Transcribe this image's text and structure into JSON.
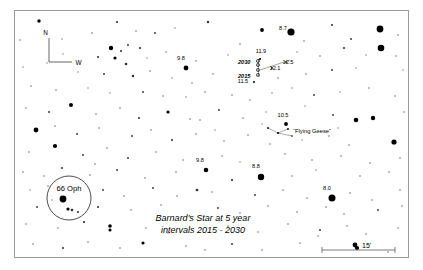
{
  "chart_data": {
    "type": "scatter",
    "title": "Barnard's Star at 5 year intervals 2015 - 2030",
    "subtitle": "",
    "xlabel": "",
    "ylabel": "",
    "grid": false,
    "legend_position": "none",
    "caption_line1": "Barnard's Star at 5 year",
    "caption_line2": "intervals 2015 - 2030",
    "compass": {
      "north_label": "N",
      "west_label": "W"
    },
    "scale_bar": {
      "label": "15'",
      "value": 15,
      "unit": "arcminutes"
    },
    "named_objects": [
      {
        "name": "66 Oph",
        "x": 69,
        "y": 198,
        "circled": true,
        "circle_radius": 22
      }
    ],
    "asterisms": [
      {
        "name": "“Flying Geese”",
        "label_x": 290,
        "label_y": 131
      }
    ],
    "barnard_track": {
      "epochs": [
        {
          "label": "2015",
          "x": 258,
          "y": 75
        },
        {
          "label": "2020",
          "x": 258,
          "y": 70
        },
        {
          "label": "2025",
          "x": 258,
          "y": 65
        },
        {
          "label": "2030",
          "x": 258,
          "y": 61
        }
      ],
      "epoch_labels_shown": [
        "2030",
        "2015"
      ]
    },
    "magnitude_labels": [
      {
        "mag": "8.7",
        "x": 283,
        "y": 30,
        "star_x": 291,
        "star_y": 32,
        "r": 3.6
      },
      {
        "mag": "11.9",
        "x": 261,
        "y": 53,
        "star_x": 260,
        "star_y": 59,
        "r": 1.1
      },
      {
        "mag": "12.5",
        "x": 288,
        "y": 64,
        "star_x": 286,
        "star_y": 62,
        "r": 0.9
      },
      {
        "mag": "12.1",
        "x": 275,
        "y": 70,
        "star_x": 272,
        "star_y": 68,
        "r": 0.9
      },
      {
        "mag": "11.5",
        "x": 243,
        "y": 83,
        "star_x": 254,
        "star_y": 82,
        "r": 1.0
      },
      {
        "mag": "9.8",
        "x": 181,
        "y": 60,
        "star_x": 186,
        "star_y": 68,
        "r": 2.4
      },
      {
        "mag": "10.5",
        "x": 283,
        "y": 117,
        "star_x": 286,
        "star_y": 124,
        "r": 1.9
      },
      {
        "mag": "9.8",
        "x": 200,
        "y": 162,
        "star_x": 206,
        "star_y": 170,
        "r": 2.3
      },
      {
        "mag": "8.8",
        "x": 256,
        "y": 168,
        "star_x": 261,
        "star_y": 177,
        "r": 3.2
      },
      {
        "mag": "8.0",
        "x": 327,
        "y": 190,
        "star_x": 332,
        "star_y": 198,
        "r": 3.5
      }
    ],
    "field_stars": [
      {
        "x": 39,
        "y": 21,
        "r": 1.7
      },
      {
        "x": 117,
        "y": 22,
        "r": 1.1
      },
      {
        "x": 208,
        "y": 22,
        "r": 1.2
      },
      {
        "x": 262,
        "y": 30,
        "r": 1.9
      },
      {
        "x": 332,
        "y": 25,
        "r": 1.0
      },
      {
        "x": 380,
        "y": 29,
        "r": 3.4
      },
      {
        "x": 20,
        "y": 40,
        "r": 0.8
      },
      {
        "x": 62,
        "y": 39,
        "r": 0.7
      },
      {
        "x": 92,
        "y": 33,
        "r": 0.8
      },
      {
        "x": 136,
        "y": 31,
        "r": 0.8
      },
      {
        "x": 155,
        "y": 33,
        "r": 0.9
      },
      {
        "x": 175,
        "y": 28,
        "r": 0.7
      },
      {
        "x": 240,
        "y": 44,
        "r": 0.8
      },
      {
        "x": 304,
        "y": 41,
        "r": 0.8
      },
      {
        "x": 351,
        "y": 39,
        "r": 0.9
      },
      {
        "x": 381,
        "y": 48,
        "r": 3.3
      },
      {
        "x": 398,
        "y": 35,
        "r": 0.8
      },
      {
        "x": 111,
        "y": 48,
        "r": 2.2
      },
      {
        "x": 121,
        "y": 51,
        "r": 1.0
      },
      {
        "x": 128,
        "y": 45,
        "r": 0.9
      },
      {
        "x": 140,
        "y": 48,
        "r": 1.1
      },
      {
        "x": 98,
        "y": 57,
        "r": 1.0
      },
      {
        "x": 115,
        "y": 58,
        "r": 1.6
      },
      {
        "x": 126,
        "y": 64,
        "r": 1.3
      },
      {
        "x": 147,
        "y": 58,
        "r": 0.7
      },
      {
        "x": 166,
        "y": 52,
        "r": 0.8
      },
      {
        "x": 196,
        "y": 61,
        "r": 0.8
      },
      {
        "x": 228,
        "y": 55,
        "r": 0.7
      },
      {
        "x": 297,
        "y": 52,
        "r": 0.7
      },
      {
        "x": 320,
        "y": 56,
        "r": 0.8
      },
      {
        "x": 344,
        "y": 48,
        "r": 1.0
      },
      {
        "x": 366,
        "y": 55,
        "r": 0.7
      },
      {
        "x": 396,
        "y": 56,
        "r": 0.8
      },
      {
        "x": 23,
        "y": 67,
        "r": 0.7
      },
      {
        "x": 47,
        "y": 63,
        "r": 0.7
      },
      {
        "x": 63,
        "y": 54,
        "r": 0.7
      },
      {
        "x": 78,
        "y": 72,
        "r": 0.7
      },
      {
        "x": 104,
        "y": 74,
        "r": 0.9
      },
      {
        "x": 133,
        "y": 76,
        "r": 1.2
      },
      {
        "x": 150,
        "y": 71,
        "r": 0.8
      },
      {
        "x": 172,
        "y": 78,
        "r": 0.7
      },
      {
        "x": 192,
        "y": 83,
        "r": 0.8
      },
      {
        "x": 213,
        "y": 74,
        "r": 0.8
      },
      {
        "x": 278,
        "y": 78,
        "r": 0.8
      },
      {
        "x": 306,
        "y": 74,
        "r": 0.8
      },
      {
        "x": 332,
        "y": 70,
        "r": 0.9
      },
      {
        "x": 356,
        "y": 68,
        "r": 0.7
      },
      {
        "x": 403,
        "y": 70,
        "r": 0.7
      },
      {
        "x": 31,
        "y": 86,
        "r": 0.8
      },
      {
        "x": 56,
        "y": 90,
        "r": 0.8
      },
      {
        "x": 88,
        "y": 88,
        "r": 0.7
      },
      {
        "x": 110,
        "y": 93,
        "r": 0.7
      },
      {
        "x": 143,
        "y": 92,
        "r": 0.9
      },
      {
        "x": 163,
        "y": 96,
        "r": 0.8
      },
      {
        "x": 186,
        "y": 97,
        "r": 0.7
      },
      {
        "x": 205,
        "y": 92,
        "r": 0.8
      },
      {
        "x": 232,
        "y": 95,
        "r": 0.8
      },
      {
        "x": 250,
        "y": 100,
        "r": 0.8
      },
      {
        "x": 272,
        "y": 93,
        "r": 0.7
      },
      {
        "x": 292,
        "y": 88,
        "r": 0.7
      },
      {
        "x": 314,
        "y": 95,
        "r": 0.9
      },
      {
        "x": 340,
        "y": 92,
        "r": 0.7
      },
      {
        "x": 369,
        "y": 88,
        "r": 0.8
      },
      {
        "x": 395,
        "y": 96,
        "r": 0.8
      },
      {
        "x": 26,
        "y": 108,
        "r": 0.8
      },
      {
        "x": 49,
        "y": 112,
        "r": 0.9
      },
      {
        "x": 71,
        "y": 105,
        "r": 2.0
      },
      {
        "x": 96,
        "y": 114,
        "r": 0.8
      },
      {
        "x": 120,
        "y": 108,
        "r": 0.8
      },
      {
        "x": 139,
        "y": 118,
        "r": 1.0
      },
      {
        "x": 168,
        "y": 112,
        "r": 1.6
      },
      {
        "x": 190,
        "y": 119,
        "r": 0.8
      },
      {
        "x": 219,
        "y": 110,
        "r": 0.9
      },
      {
        "x": 243,
        "y": 118,
        "r": 0.8
      },
      {
        "x": 266,
        "y": 112,
        "r": 0.7
      },
      {
        "x": 305,
        "y": 106,
        "r": 0.7
      },
      {
        "x": 333,
        "y": 115,
        "r": 0.9
      },
      {
        "x": 356,
        "y": 120,
        "r": 2.3
      },
      {
        "x": 373,
        "y": 118,
        "r": 2.2
      },
      {
        "x": 404,
        "y": 112,
        "r": 0.8
      },
      {
        "x": 36,
        "y": 130,
        "r": 2.4
      },
      {
        "x": 55,
        "y": 126,
        "r": 0.8
      },
      {
        "x": 77,
        "y": 134,
        "r": 0.9
      },
      {
        "x": 99,
        "y": 128,
        "r": 0.8
      },
      {
        "x": 132,
        "y": 136,
        "r": 0.9
      },
      {
        "x": 151,
        "y": 130,
        "r": 0.8
      },
      {
        "x": 172,
        "y": 140,
        "r": 1.0
      },
      {
        "x": 196,
        "y": 134,
        "r": 0.8
      },
      {
        "x": 224,
        "y": 141,
        "r": 0.8
      },
      {
        "x": 248,
        "y": 135,
        "r": 0.8
      },
      {
        "x": 270,
        "y": 144,
        "r": 0.8
      },
      {
        "x": 302,
        "y": 140,
        "r": 0.7
      },
      {
        "x": 329,
        "y": 136,
        "r": 0.8
      },
      {
        "x": 349,
        "y": 145,
        "r": 0.8
      },
      {
        "x": 394,
        "y": 142,
        "r": 2.6
      },
      {
        "x": 55,
        "y": 146,
        "r": 2.1
      },
      {
        "x": 29,
        "y": 152,
        "r": 0.8
      },
      {
        "x": 83,
        "y": 155,
        "r": 0.9
      },
      {
        "x": 107,
        "y": 148,
        "r": 0.8
      },
      {
        "x": 128,
        "y": 158,
        "r": 0.9
      },
      {
        "x": 156,
        "y": 152,
        "r": 0.8
      },
      {
        "x": 183,
        "y": 160,
        "r": 0.8
      },
      {
        "x": 222,
        "y": 156,
        "r": 0.8
      },
      {
        "x": 240,
        "y": 162,
        "r": 0.7
      },
      {
        "x": 285,
        "y": 154,
        "r": 0.8
      },
      {
        "x": 312,
        "y": 160,
        "r": 0.8
      },
      {
        "x": 341,
        "y": 156,
        "r": 0.8
      },
      {
        "x": 370,
        "y": 163,
        "r": 0.8
      },
      {
        "x": 400,
        "y": 158,
        "r": 0.8
      },
      {
        "x": 23,
        "y": 172,
        "r": 0.8
      },
      {
        "x": 62,
        "y": 168,
        "r": 1.0
      },
      {
        "x": 90,
        "y": 175,
        "r": 0.8
      },
      {
        "x": 117,
        "y": 170,
        "r": 0.9
      },
      {
        "x": 145,
        "y": 178,
        "r": 0.8
      },
      {
        "x": 176,
        "y": 172,
        "r": 0.8
      },
      {
        "x": 232,
        "y": 180,
        "r": 1.1
      },
      {
        "x": 292,
        "y": 176,
        "r": 0.8
      },
      {
        "x": 316,
        "y": 170,
        "r": 0.7
      },
      {
        "x": 360,
        "y": 176,
        "r": 0.8
      },
      {
        "x": 389,
        "y": 172,
        "r": 0.8
      },
      {
        "x": 30,
        "y": 190,
        "r": 0.7
      },
      {
        "x": 48,
        "y": 186,
        "r": 0.8
      },
      {
        "x": 103,
        "y": 190,
        "r": 0.9
      },
      {
        "x": 124,
        "y": 196,
        "r": 0.8
      },
      {
        "x": 153,
        "y": 188,
        "r": 0.9
      },
      {
        "x": 177,
        "y": 196,
        "r": 0.8
      },
      {
        "x": 197,
        "y": 190,
        "r": 1.3
      },
      {
        "x": 212,
        "y": 192,
        "r": 0.8
      },
      {
        "x": 255,
        "y": 195,
        "r": 0.9
      },
      {
        "x": 283,
        "y": 190,
        "r": 0.8
      },
      {
        "x": 307,
        "y": 198,
        "r": 0.8
      },
      {
        "x": 350,
        "y": 193,
        "r": 0.8
      },
      {
        "x": 372,
        "y": 200,
        "r": 0.8
      },
      {
        "x": 400,
        "y": 190,
        "r": 0.8
      },
      {
        "x": 37,
        "y": 207,
        "r": 0.9
      },
      {
        "x": 72,
        "y": 210,
        "r": 1.3
      },
      {
        "x": 98,
        "y": 207,
        "r": 1.0
      },
      {
        "x": 131,
        "y": 210,
        "r": 0.8
      },
      {
        "x": 161,
        "y": 205,
        "r": 0.8
      },
      {
        "x": 218,
        "y": 208,
        "r": 0.9
      },
      {
        "x": 240,
        "y": 213,
        "r": 0.8
      },
      {
        "x": 268,
        "y": 206,
        "r": 0.8
      },
      {
        "x": 297,
        "y": 212,
        "r": 0.8
      },
      {
        "x": 326,
        "y": 207,
        "r": 0.8
      },
      {
        "x": 344,
        "y": 214,
        "r": 0.8
      },
      {
        "x": 378,
        "y": 210,
        "r": 0.9
      },
      {
        "x": 402,
        "y": 206,
        "r": 0.8
      },
      {
        "x": 26,
        "y": 224,
        "r": 0.8
      },
      {
        "x": 58,
        "y": 228,
        "r": 0.8
      },
      {
        "x": 84,
        "y": 222,
        "r": 1.1
      },
      {
        "x": 110,
        "y": 226,
        "r": 1.8
      },
      {
        "x": 110,
        "y": 230,
        "r": 1.5
      },
      {
        "x": 146,
        "y": 228,
        "r": 0.8
      },
      {
        "x": 168,
        "y": 233,
        "r": 0.8
      },
      {
        "x": 228,
        "y": 226,
        "r": 0.8
      },
      {
        "x": 258,
        "y": 232,
        "r": 0.8
      },
      {
        "x": 288,
        "y": 224,
        "r": 0.8
      },
      {
        "x": 320,
        "y": 230,
        "r": 0.9
      },
      {
        "x": 347,
        "y": 226,
        "r": 0.8
      },
      {
        "x": 366,
        "y": 234,
        "r": 0.8
      },
      {
        "x": 398,
        "y": 228,
        "r": 0.8
      },
      {
        "x": 33,
        "y": 244,
        "r": 0.8
      },
      {
        "x": 63,
        "y": 248,
        "r": 1.0
      },
      {
        "x": 88,
        "y": 242,
        "r": 0.8
      },
      {
        "x": 120,
        "y": 248,
        "r": 0.8
      },
      {
        "x": 143,
        "y": 243,
        "r": 1.6
      },
      {
        "x": 186,
        "y": 246,
        "r": 0.8
      },
      {
        "x": 205,
        "y": 250,
        "r": 0.8
      },
      {
        "x": 232,
        "y": 244,
        "r": 0.9
      },
      {
        "x": 262,
        "y": 250,
        "r": 0.8
      },
      {
        "x": 300,
        "y": 243,
        "r": 0.8
      },
      {
        "x": 318,
        "y": 236,
        "r": 0.8
      },
      {
        "x": 357,
        "y": 248,
        "r": 2.1
      },
      {
        "x": 388,
        "y": 252,
        "r": 0.8
      },
      {
        "x": 44,
        "y": 176,
        "r": 0.8
      },
      {
        "x": 95,
        "y": 164,
        "r": 0.8
      },
      {
        "x": 78,
        "y": 212,
        "r": 1.0
      },
      {
        "x": 52,
        "y": 200,
        "r": 0.7
      },
      {
        "x": 200,
        "y": 120,
        "r": 0.8
      },
      {
        "x": 215,
        "y": 130,
        "r": 0.7
      },
      {
        "x": 262,
        "y": 124,
        "r": 0.7
      },
      {
        "x": 338,
        "y": 128,
        "r": 0.7
      }
    ]
  },
  "accent_colors": {
    "star": "#000000",
    "frame": "#9a9a9a",
    "text": "#000000",
    "track": "#555555",
    "background": "#ffffff"
  }
}
